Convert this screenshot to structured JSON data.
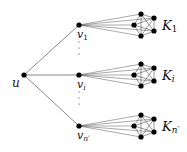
{
  "diagram": {
    "root": {
      "label": "u",
      "x": 24,
      "y": 75
    },
    "branches": [
      {
        "v_label": "v",
        "v_sub": "1",
        "vx": 79,
        "vy": 25,
        "k_label": "K",
        "k_sub": "1",
        "cy": 25
      },
      {
        "v_label": "v",
        "v_sub": "i",
        "vx": 79,
        "vy": 75,
        "k_label": "K",
        "k_sub": "i",
        "cy": 75
      },
      {
        "v_label": "v",
        "v_sub": "n′",
        "vx": 79,
        "vy": 126,
        "k_label": "K",
        "k_sub": "n′",
        "cy": 126
      }
    ],
    "ellipsis": "⋮",
    "colors": {
      "edge": "#555555",
      "node": "#000000",
      "clique_edge": "#333333"
    }
  }
}
